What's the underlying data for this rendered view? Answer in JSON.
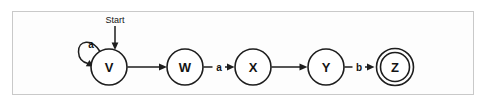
{
  "figure": {
    "kind": "state-transition-diagram",
    "frame": {
      "border_color": "#c9c9c9",
      "background": "#fdfdfd"
    },
    "stroke_color": "#1d1d1d",
    "text_color": "#141414"
  },
  "start_marker": {
    "label": "Start",
    "target_state": "V"
  },
  "states": [
    {
      "id": "V",
      "label": "V",
      "accepting": false,
      "cx": 109,
      "cy": 67,
      "r": 18
    },
    {
      "id": "W",
      "label": "W",
      "accepting": false,
      "cx": 185,
      "cy": 67,
      "r": 18
    },
    {
      "id": "X",
      "label": "X",
      "accepting": false,
      "cx": 253,
      "cy": 67,
      "r": 18
    },
    {
      "id": "Y",
      "label": "Y",
      "accepting": false,
      "cx": 326,
      "cy": 67,
      "r": 18
    },
    {
      "id": "Z",
      "label": "Z",
      "accepting": true,
      "cx": 395,
      "cy": 67,
      "r": 15
    }
  ],
  "transitions": [
    {
      "from": "V",
      "to": "V",
      "label": "a",
      "kind": "self-loop"
    },
    {
      "from": "V",
      "to": "W",
      "label": "",
      "kind": "straight"
    },
    {
      "from": "W",
      "to": "X",
      "label": "a",
      "kind": "straight"
    },
    {
      "from": "X",
      "to": "Y",
      "label": "",
      "kind": "straight"
    },
    {
      "from": "Y",
      "to": "Z",
      "label": "b",
      "kind": "straight"
    }
  ]
}
